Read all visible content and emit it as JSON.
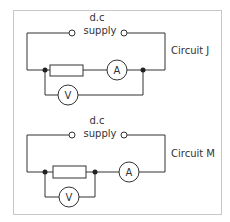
{
  "diagram": {
    "circuits": [
      {
        "id": "J",
        "name": "Circuit J",
        "supply_label_line1": "d.c",
        "supply_label_line2": "supply",
        "ammeter_label": "A",
        "voltmeter_label": "V",
        "voltmeter_across": "resistor and ammeter"
      },
      {
        "id": "M",
        "name": "Circuit M",
        "supply_label_line1": "d.c",
        "supply_label_line2": "supply",
        "ammeter_label": "A",
        "voltmeter_label": "V",
        "voltmeter_across": "resistor only"
      }
    ]
  }
}
